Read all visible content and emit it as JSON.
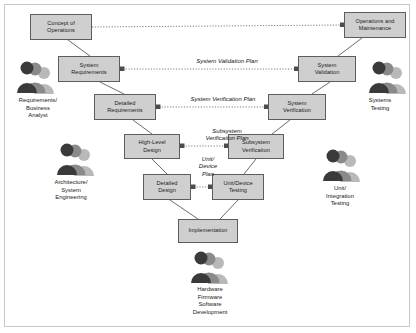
{
  "diagram": {
    "colors": {
      "node_fill": "#cfcfcf",
      "node_stroke": "#5d5d5d",
      "wire": "#6b6b6b",
      "dotted": "#7a7a7a",
      "frame": "#c9c9c9",
      "text": "#1b1b1b"
    },
    "nodes": [
      {
        "id": "concept-of-operations",
        "label": "Concept of\nOperations",
        "x": 30,
        "y": 14,
        "w": 62,
        "h": 26
      },
      {
        "id": "system-requirements",
        "label": "System\nRequirements",
        "x": 58,
        "y": 56,
        "w": 62,
        "h": 26
      },
      {
        "id": "detailed-requirements",
        "label": "Detailed\nRequirements",
        "x": 94,
        "y": 94,
        "w": 62,
        "h": 26
      },
      {
        "id": "high-level-design",
        "label": "High-Level\nDesign",
        "x": 124,
        "y": 134,
        "w": 56,
        "h": 25
      },
      {
        "id": "detailed-design",
        "label": "Detailed\nDesign",
        "x": 143,
        "y": 174,
        "w": 48,
        "h": 26
      },
      {
        "id": "implementation",
        "label": "Implementation",
        "x": 178,
        "y": 219,
        "w": 60,
        "h": 24
      },
      {
        "id": "unit-device-testing",
        "label": "Unit/Device\nTesting",
        "x": 212,
        "y": 174,
        "w": 52,
        "h": 26
      },
      {
        "id": "subsystem-verification",
        "label": "Subsystem\nVerification",
        "x": 228,
        "y": 134,
        "w": 56,
        "h": 25
      },
      {
        "id": "system-verification",
        "label": "System\nVerification",
        "x": 268,
        "y": 94,
        "w": 58,
        "h": 26
      },
      {
        "id": "system-validation",
        "label": "System\nValidation",
        "x": 298,
        "y": 56,
        "w": 58,
        "h": 26
      },
      {
        "id": "operations-and-maintenance",
        "label": "Operations and\nMaintenance",
        "x": 344,
        "y": 12,
        "w": 62,
        "h": 26
      }
    ],
    "plan_labels": [
      {
        "id": "system-validation-plan",
        "label": "System Validation Plan",
        "x": 167,
        "y": 58,
        "w": 120
      },
      {
        "id": "system-verification-plan",
        "label": "System Verification Plan",
        "x": 163,
        "y": 96,
        "w": 120
      },
      {
        "id": "subsystem-verification-plan",
        "label": "Subsystem\nVerification Plan",
        "x": 182,
        "y": 130,
        "w": 90
      },
      {
        "id": "unit-device-plan",
        "label": "Unit/\nDevice\nPlan",
        "x": 188,
        "y": 158,
        "w": 40
      }
    ],
    "roles": [
      {
        "id": "requirements-business-analyst",
        "label": "Requirements/\nBusiness\nAnalyst",
        "icon_x": 14,
        "icon_y": 62,
        "text_x": 2,
        "text_y": 98,
        "w": 72
      },
      {
        "id": "architecture-system-engineering",
        "label": "Architecture/\nSystem\nEngineering",
        "icon_x": 54,
        "icon_y": 144,
        "text_x": 30,
        "text_y": 182,
        "w": 82
      },
      {
        "id": "hardware-firmware-software-development",
        "label": "Hardware\nFirmware\nSoftware\nDevelopment",
        "icon_x": 188,
        "icon_y": 252,
        "text_x": 162,
        "text_y": 288,
        "w": 96
      },
      {
        "id": "systems-testing",
        "label": "Systems\nTesting",
        "icon_x": 370,
        "icon_y": 62,
        "text_x": 346,
        "text_y": 98,
        "w": 68
      },
      {
        "id": "unit-integration-testing",
        "label": "Unit/\nIntegration\nTesting",
        "icon_x": 324,
        "icon_y": 150,
        "text_x": 300,
        "text_y": 188,
        "w": 80
      }
    ]
  }
}
